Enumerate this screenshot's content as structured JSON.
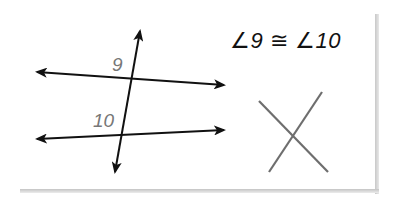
{
  "diagram": {
    "statement": {
      "angle_symbol": "∠",
      "left_angle": "9",
      "congruence_symbol": "≅",
      "right_angle": "10"
    },
    "labels": {
      "angle_top": "9",
      "angle_bottom": "10"
    },
    "figures": {
      "parallel_lines_with_transversal": "two lines cut by a transversal",
      "cross_mark": "X"
    },
    "colors": {
      "lines": "#111111",
      "labels": "#777777",
      "cross": "#6e6e6e",
      "shadow": "#c8c8c8"
    }
  }
}
